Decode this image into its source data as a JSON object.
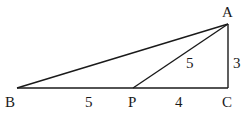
{
  "diagram": {
    "type": "geometry-triangle",
    "points": {
      "A": {
        "label": "A",
        "x": 228,
        "y": 24
      },
      "B": {
        "label": "B",
        "x": 17,
        "y": 88
      },
      "P": {
        "label": "P",
        "x": 133,
        "y": 88
      },
      "C": {
        "label": "C",
        "x": 228,
        "y": 88
      }
    },
    "segments": [
      {
        "from": "A",
        "to": "B"
      },
      {
        "from": "A",
        "to": "P"
      },
      {
        "from": "A",
        "to": "C"
      },
      {
        "from": "B",
        "to": "C"
      }
    ],
    "lengths": {
      "BP": "5",
      "PC": "4",
      "AP": "5",
      "AC": "3"
    }
  }
}
